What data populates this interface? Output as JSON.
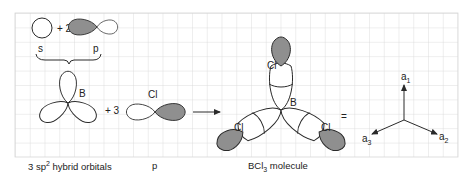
{
  "diagram": {
    "colors": {
      "grid": "#d6d6d6",
      "shade": "#8f8f8f",
      "stroke": "#2a2a2a"
    },
    "top_row": {
      "s_label": "s",
      "p_label": "p",
      "coefficient": "+ 2"
    },
    "middle": {
      "boron_label": "B",
      "coefficient": "+ 3",
      "chlorine_label": "Cl"
    },
    "molecule": {
      "center_label": "B",
      "ligand_labels": [
        "Cl",
        "Cl",
        "Cl"
      ]
    },
    "equals": "=",
    "axes": {
      "labels": [
        "a1",
        "a2",
        "a3"
      ],
      "a1_base": "a",
      "a1_sub": "1",
      "a2_base": "a",
      "a2_sub": "2",
      "a3_base": "a",
      "a3_sub": "3"
    },
    "captions": {
      "hybrid_pre": "3 sp",
      "hybrid_sup": "2",
      "hybrid_post": " hybrid orbitals",
      "p": "p",
      "molecule_pre": "BCl",
      "molecule_sub": "3",
      "molecule_post": " molecule"
    }
  }
}
